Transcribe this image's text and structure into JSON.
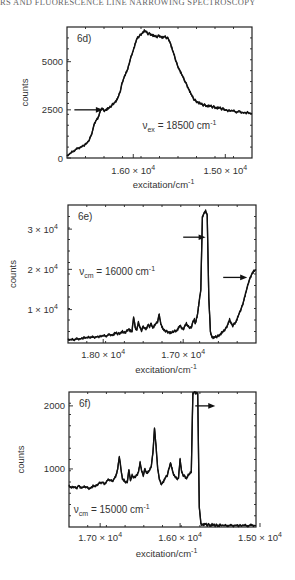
{
  "page": {
    "header_text": "RS AND FLUORESCENCE LINE NARROWING SPECTROSCOPY"
  },
  "chart_data": [
    {
      "id": "6d",
      "type": "line",
      "panel_label": "6d)",
      "title": "",
      "xlabel": "excitation/cm",
      "xlabel_sup": "-1",
      "ylabel": "counts",
      "xlim": [
        16720,
        14710
      ],
      "ylim": [
        0,
        6800
      ],
      "x_reversed": true,
      "xticks": [
        {
          "value": 16000,
          "label_mant": "1.60",
          "label_exp": "4"
        },
        {
          "value": 15000,
          "label_mant": "1.50",
          "label_exp": "4"
        }
      ],
      "yticks": [
        {
          "value": 0,
          "label": "0"
        },
        {
          "value": 2500,
          "label": "2500"
        },
        {
          "value": 5000,
          "label": "5000"
        }
      ],
      "annotation": {
        "text_prefix": "ν",
        "text_sub": "ex",
        "text_main": " = 18500 cm",
        "text_sup": "-1",
        "x": 15900,
        "y": 1500
      },
      "arrows": [
        {
          "x_from": 16640,
          "x_to": 16330,
          "y": 2500
        }
      ],
      "series": [
        {
          "name": "spectrum",
          "x": [
            16720,
            16680,
            16640,
            16600,
            16560,
            16520,
            16480,
            16450,
            16420,
            16400,
            16380,
            16360,
            16340,
            16320,
            16300,
            16280,
            16260,
            16240,
            16220,
            16200,
            16180,
            16160,
            16140,
            16120,
            16100,
            16080,
            16060,
            16040,
            16020,
            16000,
            15980,
            15960,
            15940,
            15920,
            15900,
            15880,
            15860,
            15840,
            15820,
            15800,
            15780,
            15760,
            15740,
            15720,
            15700,
            15680,
            15660,
            15640,
            15620,
            15600,
            15580,
            15560,
            15540,
            15520,
            15500,
            15480,
            15460,
            15440,
            15420,
            15400,
            15380,
            15360,
            15340,
            15320,
            15300,
            15280,
            15260,
            15240,
            15220,
            15200,
            15180,
            15160,
            15140,
            15120,
            15100,
            15080,
            15060,
            15040,
            15020,
            15000,
            14960,
            14920,
            14880,
            14840,
            14800,
            14760,
            14710
          ],
          "y": [
            100,
            250,
            400,
            500,
            600,
            700,
            900,
            1300,
            1800,
            2000,
            2100,
            2400,
            2600,
            2450,
            2500,
            2550,
            2600,
            2700,
            2800,
            2900,
            3000,
            3200,
            3500,
            3900,
            4200,
            4400,
            4600,
            5000,
            5300,
            5600,
            5900,
            6200,
            6300,
            6400,
            6500,
            6600,
            6550,
            6450,
            6450,
            6400,
            6350,
            6300,
            6300,
            6350,
            6300,
            6250,
            6300,
            6250,
            6200,
            6000,
            5700,
            5400,
            5100,
            4800,
            4600,
            4400,
            4200,
            4000,
            3800,
            3600,
            3400,
            3200,
            3050,
            2950,
            2900,
            2850,
            2800,
            2750,
            2750,
            2700,
            2700,
            2700,
            2650,
            2650,
            2600,
            2600,
            2600,
            2550,
            2550,
            2500,
            2450,
            2450,
            2400,
            2400,
            2350,
            2350,
            2300
          ]
        }
      ]
    },
    {
      "id": "6e",
      "type": "line",
      "panel_label": "6e)",
      "title": "",
      "xlabel": "excitation/cm",
      "xlabel_sup": "-1",
      "ylabel": "counts",
      "xlim": [
        18440,
        16090
      ],
      "ylim": [
        1700,
        36000
      ],
      "x_reversed": true,
      "xticks": [
        {
          "value": 18000,
          "label_mant": "1.80",
          "label_exp": "4"
        },
        {
          "value": 17000,
          "label_mant": "1.70",
          "label_exp": "4"
        }
      ],
      "yticks": [
        {
          "value": 10000,
          "label_mant": "1",
          "label_exp": "4"
        },
        {
          "value": 20000,
          "label_mant": "2",
          "label_exp": "4"
        },
        {
          "value": 30000,
          "label_mant": "3",
          "label_exp": "4"
        }
      ],
      "annotation": {
        "text_prefix": "ν",
        "text_sub": "cm",
        "text_main": " = 16000 cm",
        "text_sup": "-1",
        "x": 18300,
        "y": 18500
      },
      "arrows": [
        {
          "x_from": 17000,
          "x_to": 16720,
          "y": 28000
        },
        {
          "x_from": 16500,
          "x_to": 16200,
          "y": 18000
        }
      ],
      "series": [
        {
          "name": "spectrum",
          "x": [
            18440,
            18400,
            18360,
            18320,
            18280,
            18240,
            18200,
            18160,
            18120,
            18080,
            18040,
            18000,
            17960,
            17920,
            17880,
            17860,
            17840,
            17820,
            17800,
            17780,
            17760,
            17740,
            17720,
            17700,
            17680,
            17660,
            17640,
            17620,
            17600,
            17580,
            17560,
            17540,
            17520,
            17500,
            17480,
            17460,
            17440,
            17420,
            17400,
            17380,
            17360,
            17340,
            17320,
            17300,
            17280,
            17260,
            17240,
            17220,
            17200,
            17180,
            17160,
            17140,
            17120,
            17100,
            17080,
            17060,
            17040,
            17020,
            17000,
            16980,
            16960,
            16940,
            16920,
            16900,
            16880,
            16860,
            16850,
            16840,
            16830,
            16820,
            16810,
            16800,
            16780,
            16760,
            16740,
            16720,
            16700,
            16680,
            16660,
            16640,
            16620,
            16600,
            16580,
            16560,
            16540,
            16520,
            16500,
            16480,
            16460,
            16440,
            16420,
            16400,
            16380,
            16360,
            16340,
            16320,
            16300,
            16280,
            16260,
            16240,
            16220,
            16200,
            16180,
            16160,
            16140,
            16120,
            16090
          ],
          "y": [
            2500,
            2500,
            2600,
            2700,
            2800,
            3000,
            3000,
            3200,
            3100,
            3300,
            3300,
            3500,
            3500,
            3800,
            3700,
            4000,
            4200,
            4000,
            4000,
            4300,
            4500,
            4200,
            4400,
            4800,
            5200,
            4700,
            4500,
            8200,
            5500,
            5000,
            6800,
            5500,
            4800,
            5800,
            5400,
            5200,
            6200,
            5800,
            6500,
            5500,
            6000,
            6500,
            7000,
            8800,
            6500,
            5500,
            4800,
            4700,
            4500,
            4400,
            4200,
            4300,
            4600,
            4700,
            4800,
            5400,
            6000,
            5500,
            5000,
            6000,
            6500,
            5800,
            5600,
            5400,
            7000,
            7500,
            6500,
            7200,
            8000,
            9000,
            10500,
            12000,
            15000,
            33000,
            34000,
            34500,
            33500,
            13000,
            4500,
            3200,
            3000,
            3200,
            3300,
            3500,
            3800,
            4200,
            4500,
            5000,
            5500,
            6500,
            7500,
            6500,
            6000,
            6500,
            7000,
            8000,
            9000,
            10000,
            11000,
            12500,
            14000,
            15500,
            17000,
            18000,
            19000,
            19500,
            20000
          ]
        }
      ]
    },
    {
      "id": "6f",
      "type": "line",
      "panel_label": "6f)",
      "title": "",
      "xlabel": "excitation/cm",
      "xlabel_sup": "-1",
      "ylabel": "counts",
      "xlim": [
        17390,
        15050
      ],
      "ylim": [
        80,
        2220
      ],
      "x_reversed": true,
      "xticks": [
        {
          "value": 17000,
          "label_mant": "1.70",
          "label_exp": "4"
        },
        {
          "value": 16000,
          "label_mant": "1.60",
          "label_exp": "4"
        },
        {
          "value": 15000,
          "label_mant": "1.50",
          "label_exp": "4"
        }
      ],
      "yticks": [
        {
          "value": 1000,
          "label": "1000"
        },
        {
          "value": 2000,
          "label": "2000"
        }
      ],
      "annotation": {
        "text_prefix": "ν",
        "text_sub": "cm",
        "text_main": " = 15000 cm",
        "text_sup": "-1",
        "x": 17330,
        "y": 300
      },
      "arrows": [
        {
          "x_from": 15810,
          "x_to": 15560,
          "y": 2000
        }
      ],
      "series": [
        {
          "name": "spectrum",
          "x": [
            17390,
            17360,
            17330,
            17300,
            17270,
            17240,
            17210,
            17180,
            17150,
            17120,
            17090,
            17060,
            17030,
            17000,
            16970,
            16940,
            16910,
            16880,
            16850,
            16820,
            16800,
            16780,
            16760,
            16740,
            16720,
            16700,
            16680,
            16660,
            16640,
            16620,
            16600,
            16580,
            16560,
            16540,
            16520,
            16500,
            16480,
            16460,
            16440,
            16420,
            16400,
            16380,
            16360,
            16340,
            16320,
            16300,
            16280,
            16260,
            16240,
            16220,
            16200,
            16180,
            16160,
            16140,
            16120,
            16100,
            16080,
            16060,
            16040,
            16020,
            16000,
            15980,
            15960,
            15940,
            15920,
            15900,
            15880,
            15860,
            15840,
            15820,
            15800,
            15780,
            15760,
            15740,
            15720,
            15700,
            15680,
            15660,
            15640,
            15620,
            15600,
            15580,
            15560,
            15540,
            15520,
            15500,
            15450,
            15400,
            15350,
            15300,
            15250,
            15200,
            15150,
            15100,
            15050
          ],
          "y": [
            730,
            700,
            720,
            690,
            740,
            700,
            710,
            720,
            690,
            700,
            730,
            720,
            760,
            780,
            790,
            760,
            820,
            830,
            800,
            860,
            900,
            1000,
            1200,
            1000,
            840,
            820,
            780,
            800,
            980,
            820,
            900,
            860,
            880,
            900,
            960,
            1100,
            960,
            900,
            1000,
            940,
            950,
            980,
            1050,
            1250,
            1650,
            1350,
            1000,
            850,
            760,
            780,
            820,
            870,
            900,
            1000,
            1100,
            1000,
            900,
            880,
            840,
            860,
            1150,
            950,
            900,
            880,
            850,
            900,
            920,
            960,
            2200,
            2220,
            2200,
            2200,
            400,
            130,
            120,
            120,
            125,
            110,
            120,
            100,
            120,
            110,
            105,
            110,
            100,
            110,
            100,
            105,
            100,
            110,
            100,
            105,
            100,
            110,
            100
          ]
        }
      ]
    }
  ]
}
